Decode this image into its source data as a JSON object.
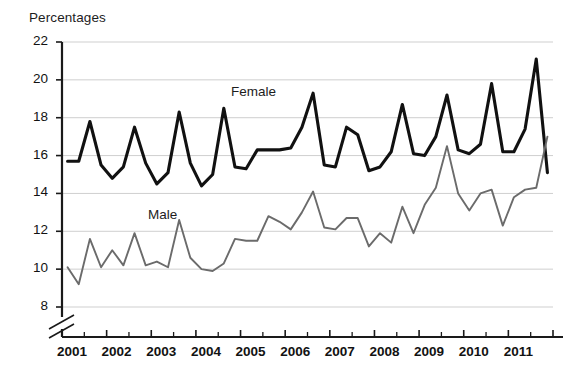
{
  "chart_data": {
    "type": "line",
    "title": "",
    "ylabel": "Percentages",
    "xlabel": "",
    "ylim": [
      8,
      22
    ],
    "ytick_values": [
      8,
      10,
      12,
      14,
      16,
      18,
      20,
      22
    ],
    "ytick_labels": [
      "8",
      "10",
      "12",
      "14",
      "16",
      "18",
      "20",
      "22"
    ],
    "y_axis_break": true,
    "grid": "horizontal",
    "legend_position": "inline-annotations",
    "categories": [
      "2001 Q1",
      "2001 Q2",
      "2001 Q3",
      "2001 Q4",
      "2002 Q1",
      "2002 Q2",
      "2002 Q3",
      "2002 Q4",
      "2003 Q1",
      "2003 Q2",
      "2003 Q3",
      "2003 Q4",
      "2004 Q1",
      "2004 Q2",
      "2004 Q3",
      "2004 Q4",
      "2005 Q1",
      "2005 Q2",
      "2005 Q3",
      "2005 Q4",
      "2006 Q1",
      "2006 Q2",
      "2006 Q3",
      "2006 Q4",
      "2007 Q1",
      "2007 Q2",
      "2007 Q3",
      "2007 Q4",
      "2008 Q1",
      "2008 Q2",
      "2008 Q3",
      "2008 Q4",
      "2009 Q1",
      "2009 Q2",
      "2009 Q3",
      "2009 Q4",
      "2010 Q1",
      "2010 Q2",
      "2010 Q3",
      "2010 Q4",
      "2011 Q1",
      "2011 Q2",
      "2011 Q3",
      "2011 Q4"
    ],
    "xtick_labels": [
      "2001",
      "2002",
      "2003",
      "2004",
      "2005",
      "2006",
      "2007",
      "2008",
      "2009",
      "2010",
      "2011"
    ],
    "series": [
      {
        "name": "Female",
        "color": "#111111",
        "line_width": 3.1,
        "values": [
          15.7,
          15.7,
          17.8,
          15.5,
          14.8,
          15.4,
          17.5,
          15.6,
          14.5,
          15.1,
          18.3,
          15.6,
          14.4,
          15.0,
          18.5,
          15.4,
          15.3,
          16.3,
          16.3,
          16.3,
          16.4,
          17.5,
          19.3,
          15.5,
          15.4,
          17.5,
          17.1,
          15.2,
          15.4,
          16.2,
          18.7,
          16.1,
          16.0,
          17.0,
          19.2,
          16.3,
          16.1,
          16.6,
          19.8,
          16.2,
          16.2,
          17.4,
          21.1,
          15.1
        ]
      },
      {
        "name": "Male",
        "color": "#6b6b6b",
        "line_width": 1.9,
        "values": [
          10.1,
          9.2,
          11.6,
          10.1,
          11.0,
          10.2,
          11.9,
          10.2,
          10.4,
          10.1,
          12.6,
          10.6,
          10.0,
          9.9,
          10.3,
          11.6,
          11.5,
          11.5,
          12.8,
          12.5,
          12.1,
          13.0,
          14.1,
          12.2,
          12.1,
          12.7,
          12.7,
          11.2,
          11.9,
          11.4,
          13.3,
          11.9,
          13.4,
          14.3,
          16.5,
          14.0,
          13.1,
          14.0,
          14.2,
          12.3,
          13.8,
          14.2,
          14.3,
          17.0
        ]
      }
    ],
    "annotations": [
      {
        "text": "Female",
        "series": "Female"
      },
      {
        "text": "Male",
        "series": "Male"
      }
    ]
  }
}
